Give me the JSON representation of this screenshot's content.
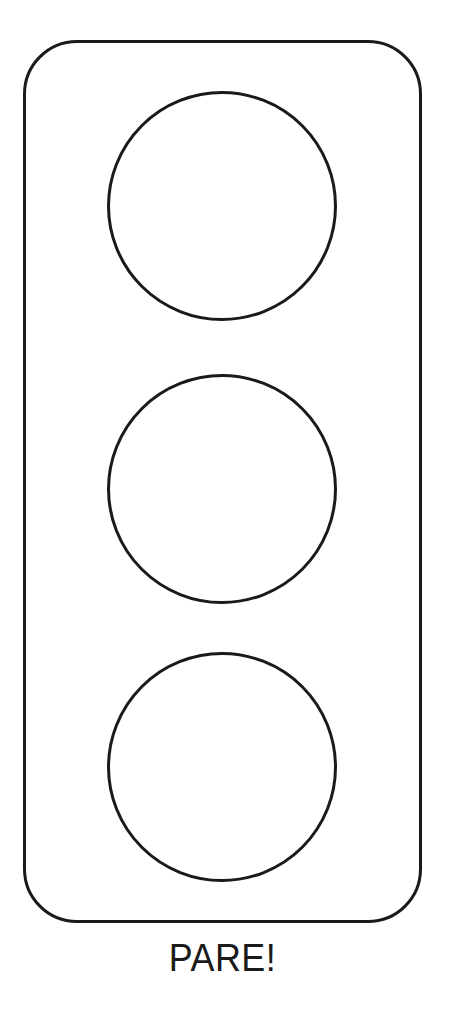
{
  "page": {
    "background_color": "#ffffff",
    "ink_color": "#1a1a1a"
  },
  "figure": {
    "type": "traffic-light-outline-drawing",
    "caption": "PARE!",
    "lights": [
      {
        "id": "top",
        "filled": false
      },
      {
        "id": "middle",
        "filled": false
      },
      {
        "id": "bottom",
        "filled": false
      }
    ]
  }
}
